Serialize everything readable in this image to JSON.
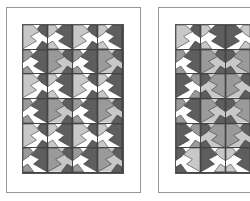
{
  "colors": {
    "white": "#ffffff",
    "light": "#c8c8c8",
    "mid": "#9a9a9a",
    "dark": "#5e5e5e",
    "line": "#333333",
    "frame": "#9a9a9a"
  },
  "panels": [
    {
      "name": "quilt-panel-left",
      "frame": {
        "x": 6,
        "y": 7,
        "w": 135,
        "h": 186
      },
      "grid": {
        "x": 22,
        "y": 24
      },
      "rows": [
        [
          "A",
          "B",
          "A",
          "B"
        ],
        [
          "C",
          "D",
          "C",
          "D"
        ],
        [
          "A",
          "B",
          "A",
          "B"
        ],
        [
          "C",
          "D",
          "C",
          "D"
        ],
        [
          "A",
          "B",
          "A",
          "B"
        ],
        [
          "C",
          "D",
          "C",
          "D"
        ]
      ]
    },
    {
      "name": "quilt-panel-right",
      "frame": {
        "x": 158,
        "y": 7,
        "w": 135,
        "h": 186
      },
      "grid": {
        "x": 175,
        "y": 24
      },
      "rows": [
        [
          "A",
          "B",
          "B",
          "B"
        ],
        [
          "C",
          "D",
          "D",
          "D"
        ],
        [
          "C",
          "D",
          "D",
          "D"
        ],
        [
          "C",
          "D",
          "D",
          "D"
        ],
        [
          "C",
          "D",
          "D",
          "D"
        ],
        [
          "A",
          "B",
          "B",
          "B"
        ]
      ]
    }
  ],
  "tile_styles": {
    "A": {
      "bg": "#ffffff",
      "arm": "#c8c8c8",
      "corner": "#5e5e5e"
    },
    "B": {
      "bg": "#ffffff",
      "arm": "#5e5e5e",
      "corner": "#c8c8c8"
    },
    "C": {
      "bg": "#ffffff",
      "arm": "#5e5e5e",
      "corner": "#9a9a9a"
    },
    "D": {
      "bg": "#c8c8c8",
      "arm": "#9a9a9a",
      "corner": "#5e5e5e"
    }
  }
}
